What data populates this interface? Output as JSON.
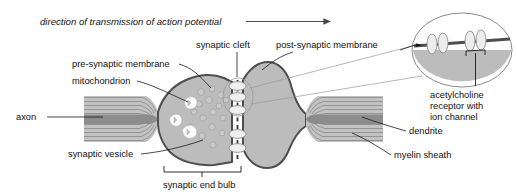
{
  "figure": {
    "width": 517,
    "height": 196,
    "background_color": "#ffffff"
  },
  "arrow_caption": {
    "text": "direction of transmission of action potential",
    "style": "italic",
    "arrow": "rightwards-arrow"
  },
  "labels": {
    "pre_synaptic_membrane": "pre-synaptic membrane",
    "mitochondrion": "mitochondrion",
    "axon": "axon",
    "synaptic_vesicle": "synaptic vesicle",
    "synaptic_cleft": "synaptic cleft",
    "post_synaptic_membrane": "post-synaptic membrane",
    "dendrite": "dendrite",
    "myelin_sheath": "myelin sheath",
    "synaptic_end_bulb": "synaptic end bulb",
    "acetylcholine_receptor_line1": "acetylcholine",
    "acetylcholine_receptor_line2": "receptor with",
    "acetylcholine_receptor_line3": "ion channel"
  },
  "colors": {
    "cell_fill": "#b9b9b9",
    "cell_fill_light": "#c6c6c6",
    "membrane_outline": "#4e4e4e",
    "vesicle_fill": "#c9c9c9",
    "vesicle_stroke": "#9a9a9a",
    "mitochondrion_fill": "#fbfbfb",
    "receptor_fill": "#e8e8e8",
    "receptor_stroke": "#8f8f8f",
    "myelin_stripe": "#8d8d8d",
    "axon_core": "#8c8c8c",
    "leader_line": "#1a1a1a",
    "zoom_line": "#9a9a9a",
    "text": "#111111"
  },
  "structures": {
    "axon": "myelinated axon entering from left",
    "synaptic_end_bulb": "terminal bouton containing vesicles and mitochondria",
    "synaptic_cleft": "narrow gap between pre- and post-synaptic membranes",
    "dendrite": "myelinated dendrite exiting to the right",
    "inset": "magnified oval view of post-synaptic membrane receptors"
  },
  "counts": {
    "mitochondria": 3,
    "synaptic_vesicles": 16,
    "cleft_receptors": 5,
    "inset_receptors": 4
  }
}
